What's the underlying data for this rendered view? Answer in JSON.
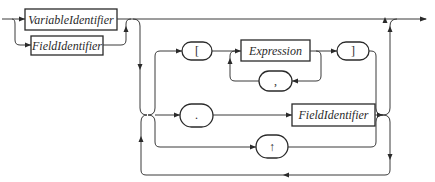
{
  "diagram": {
    "type": "syntax-railroad-diagram",
    "nonterminals": {
      "variable_identifier": "VariableIdentifier",
      "field_identifier_left": "FieldIdentifier",
      "expression": "Expression",
      "field_identifier_right": "FieldIdentifier"
    },
    "terminals": {
      "open_bracket": "[",
      "close_bracket": "]",
      "comma": ",",
      "dot": ".",
      "up_arrow": "↑"
    },
    "colors": {
      "line": "#3a3a3a",
      "stroke": "#2a2a2a",
      "background": "#ffffff"
    }
  }
}
